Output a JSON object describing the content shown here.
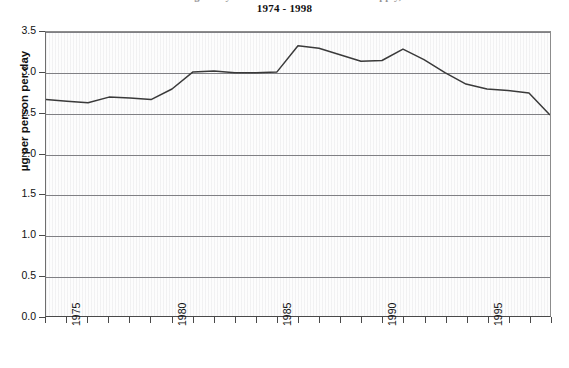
{
  "title": {
    "line1_clipped": "Average Daily Intake of Nutrient from Food Supply,",
    "line2": "1974 - 1998"
  },
  "axes": {
    "ylabel": "µg per person per day",
    "yticks": [
      "0.0",
      "0.5",
      "1.0",
      "1.5",
      "2.0",
      "2.5",
      "3.0",
      "3.5"
    ],
    "xticks_labeled": [
      "1975",
      "1980",
      "1985",
      "1990",
      "1995"
    ]
  },
  "chart_data": {
    "type": "line",
    "title": "1974 - 1998",
    "xlabel": "",
    "ylabel": "µg per person per day",
    "xlim": [
      1974,
      1998
    ],
    "ylim": [
      0.0,
      3.5
    ],
    "ytick_values": [
      0.0,
      0.5,
      1.0,
      1.5,
      2.0,
      2.5,
      3.0,
      3.5
    ],
    "xtick_values": [
      1974,
      1975,
      1976,
      1977,
      1978,
      1979,
      1980,
      1981,
      1982,
      1983,
      1984,
      1985,
      1986,
      1987,
      1988,
      1989,
      1990,
      1991,
      1992,
      1993,
      1994,
      1995,
      1996,
      1997,
      1998
    ],
    "xtick_labels_shown": [
      1975,
      1980,
      1985,
      1990,
      1995
    ],
    "grid": "horizontal",
    "legend": "none",
    "line_color": "#3a3a3a",
    "x": [
      1974,
      1975,
      1976,
      1977,
      1978,
      1979,
      1980,
      1981,
      1982,
      1983,
      1984,
      1985,
      1986,
      1987,
      1988,
      1989,
      1990,
      1991,
      1992,
      1993,
      1994,
      1995,
      1996,
      1997,
      1998
    ],
    "values": [
      2.67,
      2.65,
      2.63,
      2.7,
      2.69,
      2.67,
      2.8,
      3.01,
      3.02,
      3.0,
      3.0,
      3.01,
      3.33,
      3.3,
      3.22,
      3.14,
      3.15,
      3.29,
      3.16,
      3.0,
      2.86,
      2.8,
      2.78,
      2.75,
      2.48
    ],
    "series": [
      {
        "name": "Average daily intake",
        "values": [
          2.67,
          2.65,
          2.63,
          2.7,
          2.69,
          2.67,
          2.8,
          3.01,
          3.02,
          3.0,
          3.0,
          3.01,
          3.33,
          3.3,
          3.22,
          3.14,
          3.15,
          3.29,
          3.16,
          3.0,
          2.86,
          2.8,
          2.78,
          2.75,
          2.48
        ]
      }
    ]
  }
}
